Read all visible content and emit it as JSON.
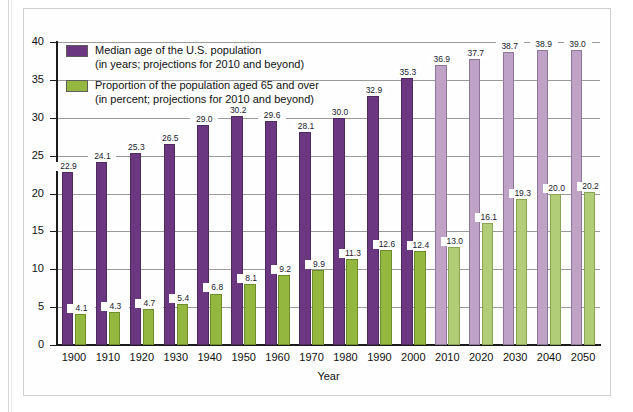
{
  "chart_data": {
    "type": "bar",
    "title": "",
    "xlabel": "Year",
    "ylabel": "",
    "ylim": [
      0,
      40
    ],
    "yticks": [
      0,
      5,
      10,
      15,
      20,
      25,
      30,
      35,
      40
    ],
    "grid": true,
    "legend_position": "top-left",
    "categories": [
      "1900",
      "1910",
      "1920",
      "1930",
      "1940",
      "1950",
      "1960",
      "1970",
      "1980",
      "1990",
      "2000",
      "2010",
      "2020",
      "2030",
      "2040",
      "2050"
    ],
    "projected_from": "2010",
    "series": [
      {
        "name": "Median age of the U.S. population",
        "unit": "years",
        "color": "#6b3780",
        "projected_color": "#bfa3c6",
        "values": [
          22.9,
          24.1,
          25.3,
          26.5,
          29.0,
          30.2,
          29.6,
          28.1,
          30.0,
          32.9,
          35.3,
          36.9,
          37.7,
          38.7,
          38.9,
          39.0
        ],
        "labels": [
          "22.9",
          "24.1",
          "25.3",
          "26.5",
          "29.0",
          "30.2",
          "29.6",
          "28.1",
          "30.0",
          "32.9",
          "35.3",
          "36.9",
          "37.7",
          "38.7",
          "38.9",
          "39.0"
        ]
      },
      {
        "name": "Proportion of the population aged 65 and over",
        "unit": "percent",
        "color": "#94b83f",
        "projected_color": "#b2cd78",
        "values": [
          4.1,
          4.3,
          4.7,
          5.4,
          6.8,
          8.1,
          9.2,
          9.9,
          11.3,
          12.6,
          12.4,
          13.0,
          16.1,
          19.3,
          20.0,
          20.2
        ],
        "labels": [
          "4.1",
          "4.3",
          "4.7",
          "5.4",
          "6.8",
          "8.1",
          "9.2",
          "9.9",
          "11.3",
          "12.6",
          "12.4",
          "13.0",
          "16.1",
          "19.3",
          "20.0",
          "20.2"
        ]
      }
    ]
  },
  "legend": {
    "items": [
      {
        "swatch": "purple",
        "line1": "Median age of the U.S. population",
        "line2": "(in years; projections for 2010 and beyond)"
      },
      {
        "swatch": "green",
        "line1": "Proportion of the population aged 65 and over",
        "line2": "(in percent; projections for 2010 and beyond)"
      }
    ]
  },
  "axes": {
    "x_title": "Year",
    "y_tick_labels": [
      "0",
      "5",
      "10",
      "15",
      "20",
      "25",
      "30",
      "35",
      "40"
    ],
    "x_tick_labels": [
      "1900",
      "1910",
      "1920",
      "1930",
      "1940",
      "1950",
      "1960",
      "1970",
      "1980",
      "1990",
      "2000",
      "2010",
      "2020",
      "2030",
      "2040",
      "2050"
    ]
  }
}
